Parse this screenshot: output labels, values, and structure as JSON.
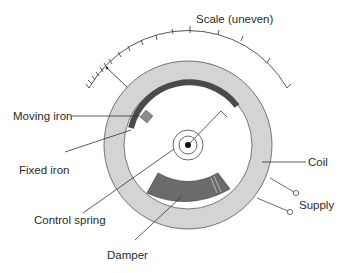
{
  "diagram": {
    "type": "moving-iron instrument (repulsion type) schematic",
    "labels": {
      "scale": "Scale (uneven)",
      "moving_iron": "Moving iron",
      "fixed_iron": "Fixed iron",
      "coil": "Coil",
      "control_spring": "Control spring",
      "supply": "Supply",
      "damper": "Damper"
    },
    "colors": {
      "coil_fill": "#d2d2d2",
      "iron_dark": "#4a4a4a",
      "moving_iron_fill": "#8c8c8c",
      "damper_fill": "#6b6b6b",
      "line": "#333333"
    }
  }
}
